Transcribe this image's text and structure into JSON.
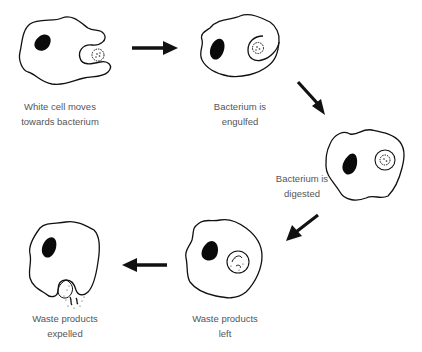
{
  "diagram": {
    "stages": [
      {
        "id": 1,
        "label_lines": [
          "White cell moves",
          "towards bacterium"
        ]
      },
      {
        "id": 2,
        "label_lines": [
          "Bacterium is",
          "engulfed"
        ]
      },
      {
        "id": 3,
        "label_lines": [
          "Bacterium is",
          "digested"
        ]
      },
      {
        "id": 4,
        "label_lines": [
          "Waste products",
          "left"
        ]
      },
      {
        "id": 5,
        "label_lines": [
          "Waste products",
          "expelled"
        ]
      }
    ],
    "arrows": [
      {
        "from": 1,
        "to": 2,
        "direction": "right"
      },
      {
        "from": 2,
        "to": 3,
        "direction": "down-right"
      },
      {
        "from": 3,
        "to": 4,
        "direction": "down-left"
      },
      {
        "from": 4,
        "to": 5,
        "direction": "left"
      }
    ],
    "colors": {
      "stroke": "#111111",
      "nucleus": "#0a0a0a",
      "label": "#555555",
      "background": "#ffffff"
    }
  }
}
